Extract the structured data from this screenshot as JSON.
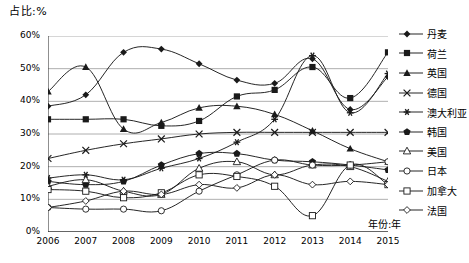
{
  "chart_data": {
    "type": "line",
    "title": "",
    "ylabel": "占比:%",
    "xlabel": "年份:年",
    "ylim": [
      0,
      60
    ],
    "ytick_labels": [
      "0%",
      "10%",
      "20%",
      "30%",
      "40%",
      "50%",
      "60%"
    ],
    "ytick_values": [
      0,
      10,
      20,
      30,
      40,
      50,
      60
    ],
    "grid": true,
    "legend_position": "right",
    "categories": [
      "2006",
      "2007",
      "2008",
      "2009",
      "2010",
      "2011",
      "2012",
      "2013",
      "2014",
      "2015"
    ],
    "x": [
      2006,
      2007,
      2008,
      2009,
      2010,
      2011,
      2012,
      2013,
      2014,
      2015
    ],
    "series": [
      {
        "name": "丹麦",
        "marker": "filled-diamond",
        "values": [
          38.5,
          42.0,
          55.0,
          56.0,
          51.5,
          46.5,
          45.5,
          53.0,
          37.5,
          47.5
        ]
      },
      {
        "name": "荷兰",
        "marker": "filled-square",
        "values": [
          34.5,
          34.5,
          34.5,
          32.5,
          34.0,
          41.5,
          43.5,
          50.5,
          41.0,
          55.0
        ]
      },
      {
        "name": "英国",
        "marker": "filled-triangle",
        "values": [
          43.0,
          50.5,
          31.5,
          33.5,
          38.0,
          38.5,
          36.0,
          31.0,
          25.5,
          21.5
        ]
      },
      {
        "name": "德国",
        "marker": "x-cross",
        "values": [
          22.5,
          25.0,
          27.0,
          28.5,
          30.0,
          30.5,
          30.5,
          30.5,
          30.5,
          30.5
        ]
      },
      {
        "name": "澳大利亚",
        "marker": "star",
        "values": [
          16.5,
          17.5,
          16.0,
          19.5,
          22.5,
          27.5,
          34.5,
          54.0,
          36.5,
          48.5
        ]
      },
      {
        "name": "韩国",
        "marker": "filled-pentagon",
        "values": [
          15.5,
          14.5,
          15.5,
          20.5,
          24.0,
          24.0,
          22.0,
          21.5,
          20.5,
          19.0
        ]
      },
      {
        "name": "美国",
        "marker": "hollow-triangle",
        "values": [
          14.0,
          16.0,
          12.5,
          11.5,
          19.5,
          21.5,
          17.5,
          20.5,
          20.0,
          15.5
        ]
      },
      {
        "name": "日本",
        "marker": "hollow-circle",
        "values": [
          7.5,
          7.0,
          7.0,
          6.5,
          12.5,
          17.5,
          22.0,
          20.5,
          20.5,
          21.5
        ]
      },
      {
        "name": "加拿大",
        "marker": "hollow-square",
        "values": [
          13.0,
          12.5,
          10.5,
          12.0,
          17.5,
          17.0,
          14.0,
          5.0,
          20.5,
          14.5
        ]
      },
      {
        "name": "法国",
        "marker": "hollow-diamond",
        "values": [
          7.5,
          9.5,
          12.5,
          11.5,
          14.5,
          13.5,
          17.5,
          14.5,
          15.5,
          14.5
        ]
      }
    ]
  },
  "legend": {
    "items": [
      {
        "label": "丹麦"
      },
      {
        "label": "荷兰"
      },
      {
        "label": "英国"
      },
      {
        "label": "德国"
      },
      {
        "label": "澳大利亚"
      },
      {
        "label": "韩国"
      },
      {
        "label": "美国"
      },
      {
        "label": "日本"
      },
      {
        "label": "加拿大"
      },
      {
        "label": "法国"
      }
    ]
  },
  "colors": {
    "line": "#1a1a1a",
    "grid": "#9a9a9a",
    "axis": "#333333",
    "background": "#ffffff"
  }
}
